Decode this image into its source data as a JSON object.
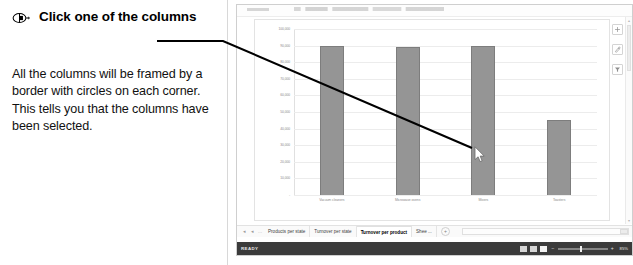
{
  "callout": {
    "icon": "mouse-click-icon",
    "title": "Click one of the columns",
    "body": "All the columns will be framed by a border with circles on each corner. This tells you that the columns have been selected."
  },
  "excel": {
    "status_text": "READY",
    "zoom_value": "85%",
    "sheet_tabs": [
      {
        "label": "Products per state",
        "active": false
      },
      {
        "label": "Turnover per state",
        "active": false
      },
      {
        "label": "Turnover per product",
        "active": true
      },
      {
        "label": "Shee ...",
        "active": false
      }
    ],
    "add_sheet_label": "+",
    "nav_first": "◂",
    "nav_prev": "◂",
    "nav_more": "…",
    "chart_side_buttons": [
      {
        "name": "chart-elements-button",
        "glyph": "+"
      },
      {
        "name": "chart-styles-button",
        "glyph": "✎"
      },
      {
        "name": "chart-filters-button",
        "glyph": "▼"
      }
    ],
    "view_buttons": [
      {
        "name": "normal-view-button",
        "selected": false
      },
      {
        "name": "page-layout-view-button",
        "selected": false
      },
      {
        "name": "page-break-view-button",
        "selected": true
      }
    ],
    "zoom_minus": "−",
    "zoom_plus": "+",
    "scroll_up": "▴",
    "scroll_down": "▾",
    "scroll_right": "▸"
  },
  "chart_data": {
    "type": "bar",
    "title": "",
    "categories": [
      "Vacuum cleaners",
      "Microwave ovens",
      "Mixers",
      "Toasters"
    ],
    "values": [
      90000,
      89000,
      89500,
      45000
    ],
    "series": [
      {
        "name": "Turnover per product",
        "values": [
          90000,
          89000,
          89500,
          45000
        ]
      }
    ],
    "xlabel": "",
    "ylabel": "",
    "ylim": [
      0,
      100000
    ],
    "yticks": [
      0,
      10000,
      20000,
      30000,
      40000,
      50000,
      60000,
      70000,
      80000,
      90000,
      100000
    ],
    "ytick_labels": [
      "-",
      "10,000",
      "20,000",
      "30,000",
      "40,000",
      "50,000",
      "60,000",
      "70,000",
      "80,000",
      "90,000",
      "100,000"
    ],
    "grid": true,
    "legend": "none",
    "bar_color": "#959595",
    "bar_border_color": "#7d7d7d"
  }
}
